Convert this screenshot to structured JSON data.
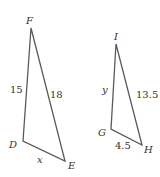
{
  "diagram": {
    "type": "similar-triangles",
    "triangles": [
      {
        "name": "DEF",
        "vertices": {
          "F": "F",
          "D": "D",
          "E": "E"
        },
        "sides": {
          "DF": "15",
          "EF": "18",
          "DE": "x"
        }
      },
      {
        "name": "GHI",
        "vertices": {
          "I": "I",
          "G": "G",
          "H": "H"
        },
        "sides": {
          "GI": "y",
          "HI": "13.5",
          "GH": "4.5"
        }
      }
    ],
    "colors": {
      "line": "#5a5a5a",
      "text": "#333333",
      "background": "#ffffff"
    }
  }
}
